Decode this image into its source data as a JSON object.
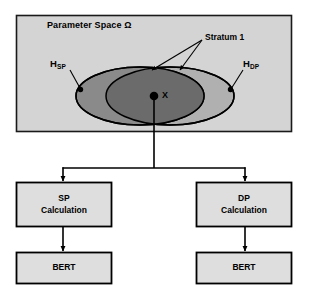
{
  "diagram": {
    "parameter_space": {
      "label": "Parameter Space Ω",
      "background_color": "#d4d4d4",
      "border_color": "#1a1a1a"
    },
    "annotations": {
      "stratum_label": "Stratum 1",
      "hsp_base": "H",
      "hsp_sub": "SP",
      "hdp_base": "H",
      "hdp_sub": "DP",
      "point_label": "X"
    },
    "regions": [
      {
        "name": "hsp-ellipse",
        "label": "H_SP",
        "fill_color": "#8c8c8c"
      },
      {
        "name": "hdp-ellipse",
        "label": "H_DP",
        "fill_color": "#b3b3b3"
      },
      {
        "name": "intersection-ellipse",
        "label": "Stratum 1",
        "fill_color": "#6e6e6e"
      }
    ],
    "boxes": [
      {
        "name": "sp-calculation",
        "line1": "SP",
        "line2": "Calculation",
        "fill_color": "#dedede"
      },
      {
        "name": "dp-calculation",
        "line1": "DP",
        "line2": "Calculation",
        "fill_color": "#dedede"
      },
      {
        "name": "bert-left",
        "line1": "BERT",
        "line2": "",
        "fill_color": "#dedede"
      },
      {
        "name": "bert-right",
        "line1": "BERT",
        "line2": "",
        "fill_color": "#dedede"
      }
    ],
    "colors": {
      "line": "#000000",
      "page_background": "#ffffff"
    }
  }
}
